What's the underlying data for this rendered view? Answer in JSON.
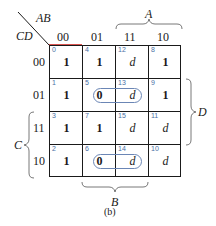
{
  "kmap": {
    "row_var": "CD",
    "col_var": "AB",
    "col_labels": [
      "00",
      "01",
      "11",
      "10"
    ],
    "row_labels": [
      "00",
      "01",
      "11",
      "10"
    ],
    "cells": [
      [
        {
          "idx": "0",
          "val": "1"
        },
        {
          "idx": "4",
          "val": "1"
        },
        {
          "idx": "12",
          "val": "d"
        },
        {
          "idx": "8",
          "val": "1"
        }
      ],
      [
        {
          "idx": "1",
          "val": "1"
        },
        {
          "idx": "5",
          "val": "0"
        },
        {
          "idx": "13",
          "val": "d"
        },
        {
          "idx": "9",
          "val": "1"
        }
      ],
      [
        {
          "idx": "3",
          "val": "1"
        },
        {
          "idx": "7",
          "val": "1"
        },
        {
          "idx": "15",
          "val": "d"
        },
        {
          "idx": "11",
          "val": "d"
        }
      ],
      [
        {
          "idx": "2",
          "val": "1"
        },
        {
          "idx": "6",
          "val": "0"
        },
        {
          "idx": "14",
          "val": "d"
        },
        {
          "idx": "10",
          "val": "d"
        }
      ]
    ],
    "brace_labels": {
      "A": "A",
      "B": "B",
      "C": "C",
      "D": "D"
    },
    "groups": [
      {
        "cells": [
          "5",
          "13"
        ],
        "color": "#6b86b5"
      },
      {
        "cells": [
          "6",
          "14"
        ],
        "color": "#6b86b5"
      }
    ],
    "accent_color": "#d9534f"
  },
  "caption": "(b)"
}
